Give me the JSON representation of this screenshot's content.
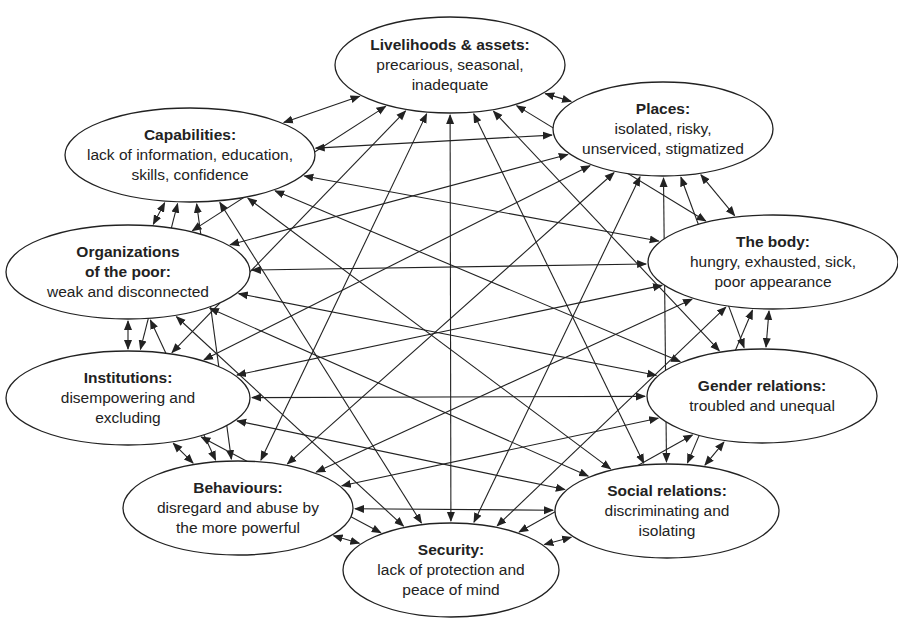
{
  "diagram": {
    "type": "interconnected-node-network",
    "colors": {
      "background": "#ffffff",
      "stroke": "#222222",
      "text": "#222222"
    },
    "nodes": [
      {
        "id": "livelihoods",
        "title": "Livelihoods & assets:",
        "desc": [
          "precarious, seasonal,",
          "inadequate"
        ],
        "cx": 450,
        "cy": 65,
        "rx": 115,
        "ry": 48
      },
      {
        "id": "places",
        "title": "Places:",
        "desc": [
          "isolated, risky,",
          "unserviced, stigmatized"
        ],
        "cx": 663,
        "cy": 129,
        "rx": 110,
        "ry": 47
      },
      {
        "id": "body",
        "title": "The body:",
        "desc": [
          "hungry, exhausted, sick,",
          "poor appearance"
        ],
        "cx": 773,
        "cy": 262,
        "rx": 125,
        "ry": 47
      },
      {
        "id": "gender",
        "title": "Gender relations:",
        "desc": [
          "troubled and unequal"
        ],
        "cx": 762,
        "cy": 396,
        "rx": 115,
        "ry": 47
      },
      {
        "id": "social",
        "title": "Social relations:",
        "desc": [
          "discriminating and",
          "isolating"
        ],
        "cx": 667,
        "cy": 511,
        "rx": 112,
        "ry": 47
      },
      {
        "id": "security",
        "title": "Security:",
        "desc": [
          "lack of protection and",
          "peace of mind"
        ],
        "cx": 451,
        "cy": 570,
        "rx": 108,
        "ry": 47
      },
      {
        "id": "behaviours",
        "title": "Behaviours:",
        "desc": [
          "disregard and abuse by",
          "the more powerful"
        ],
        "cx": 238,
        "cy": 508,
        "rx": 115,
        "ry": 47
      },
      {
        "id": "institutions",
        "title": "Institutions:",
        "desc": [
          "disempowering and",
          "excluding"
        ],
        "cx": 128,
        "cy": 398,
        "rx": 122,
        "ry": 47
      },
      {
        "id": "organizations",
        "title": "Organizations",
        "title2": "of the poor:",
        "desc": [
          "weak and disconnected"
        ],
        "cx": 128,
        "cy": 272,
        "rx": 122,
        "ry": 47
      },
      {
        "id": "capabilities",
        "title": "Capabilities:",
        "desc": [
          "lack of information, education,",
          "skills, confidence"
        ],
        "cx": 190,
        "cy": 155,
        "rx": 125,
        "ry": 47
      }
    ],
    "connections": "all-pairs-bidirectional"
  }
}
